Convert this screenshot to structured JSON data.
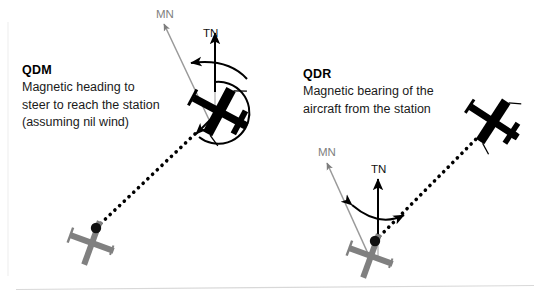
{
  "diagram": {
    "title_semantics": "QDM and QDR magnetic navigation bearings diagram",
    "background_color": "#ffffff",
    "divider_color": "#d8d8d8",
    "colors": {
      "aircraft": "#000000",
      "station": "#808080",
      "magnetic_north": "#8c8c8c",
      "true_north": "#000000",
      "bearing_line": "#000000",
      "arc": "#000000"
    }
  },
  "panels": [
    {
      "id": "qdm",
      "code": "QDM",
      "description_lines": [
        "Magnetic heading to",
        "steer to reach the station",
        "(assuming nil wind)"
      ],
      "north_labels": {
        "magnetic": "MN",
        "true": "TN"
      }
    },
    {
      "id": "qdr",
      "code": "QDR",
      "description_lines": [
        "Magnetic bearing of the",
        "aircraft from the station"
      ],
      "north_labels": {
        "magnetic": "MN",
        "true": "TN"
      }
    }
  ],
  "elements": {
    "aircraft_left_name": "aircraft-symbol",
    "aircraft_right_name": "aircraft-symbol",
    "station_left_name": "ndb-station-symbol",
    "station_right_name": "ndb-station-symbol",
    "bearing_line_name": "dotted-bearing-line",
    "heading_arc_name": "heading-arc",
    "angle_arrow_name": "angle-arc-arrow"
  }
}
